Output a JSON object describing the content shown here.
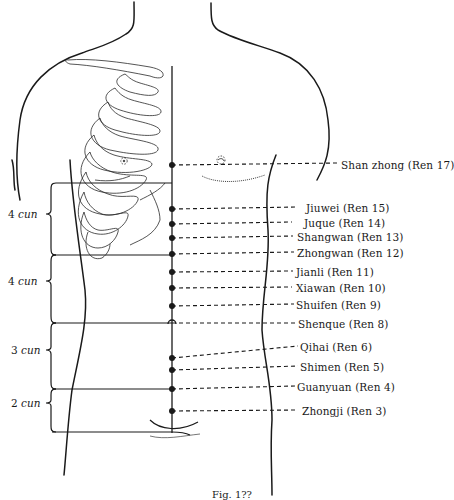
{
  "figure": {
    "caption": "Fig. 1??",
    "line_color": "#1a1a1a",
    "midline_x": 172,
    "points": [
      {
        "name": "Shanzhong",
        "code": "Ren 17",
        "label": "Shan zhong (Ren 17)",
        "y": 165,
        "label_x": 341,
        "label_y": 159
      },
      {
        "name": "Jiuwei",
        "code": "Ren 15",
        "label": "Jiuwei (Ren 15)",
        "y": 209,
        "label_x": 306,
        "label_y": 202
      },
      {
        "name": "Juque",
        "code": "Ren 14",
        "label": "Juque (Ren 14)",
        "y": 224,
        "label_x": 304,
        "label_y": 217
      },
      {
        "name": "Shangwan",
        "code": "Ren 13",
        "label": "Shangwan (Ren 13)",
        "y": 238,
        "label_x": 297,
        "label_y": 231
      },
      {
        "name": "Zhongwan",
        "code": "Ren 12",
        "label": "Zhongwan (Ren 12)",
        "y": 254,
        "label_x": 297,
        "label_y": 247
      },
      {
        "name": "Jianli",
        "code": "Ren 11",
        "label": "Jianli (Ren 11)",
        "y": 272,
        "label_x": 296,
        "label_y": 266
      },
      {
        "name": "Xiawan",
        "code": "Ren 10",
        "label": "Xiawan (Ren 10)",
        "y": 288,
        "label_x": 296,
        "label_y": 282
      },
      {
        "name": "Shuifen",
        "code": "Ren 9",
        "label": "Shuifen (Ren 9)",
        "y": 306,
        "label_x": 296,
        "label_y": 299
      },
      {
        "name": "Shenque",
        "code": "Ren 8",
        "label": "Shenque (Ren 8)",
        "y": 323,
        "label_x": 298,
        "label_y": 318
      },
      {
        "name": "Qihai",
        "code": "Ren 6",
        "label": "Qihai (Ren 6)",
        "y": 358,
        "label_x": 300,
        "label_y": 341
      },
      {
        "name": "Shimen",
        "code": "Ren 5",
        "label": "Shimen (Ren 5)",
        "y": 370,
        "label_x": 300,
        "label_y": 361
      },
      {
        "name": "Guanyuan",
        "code": "Ren 4",
        "label": "Guanyuan (Ren 4)",
        "y": 389,
        "label_x": 297,
        "label_y": 381
      },
      {
        "name": "Zhongji",
        "code": "Ren 3",
        "label": "Zhongji (Ren 3)",
        "y": 411,
        "label_x": 302,
        "label_y": 405
      }
    ],
    "cun_measures": [
      {
        "value": "4",
        "unit": "cun",
        "top": 183,
        "bottom": 255,
        "label_y": 214
      },
      {
        "value": "4",
        "unit": "cun",
        "top": 255,
        "bottom": 323,
        "label_y": 281
      },
      {
        "value": "3",
        "unit": "cun",
        "top": 323,
        "bottom": 389,
        "label_y": 350
      },
      {
        "value": "2",
        "unit": "cun",
        "top": 389,
        "bottom": 432,
        "label_y": 402
      }
    ]
  }
}
